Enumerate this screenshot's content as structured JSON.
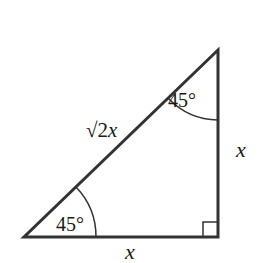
{
  "diagram": {
    "type": "right-isosceles-triangle",
    "vertices": {
      "apex": [
        218,
        50
      ],
      "bottom_left": [
        24,
        237
      ],
      "right_angle": [
        218,
        237
      ]
    },
    "labels": {
      "hypotenuse": "√2x",
      "hypotenuse_radical": "√2",
      "hypotenuse_var": "x",
      "right_side": "x",
      "bottom_side": "x",
      "top_angle": "45°",
      "bottom_angle": "45°"
    },
    "right_angle_marker": true,
    "colors": {
      "stroke": "#333333",
      "text": "#1a1a1a",
      "background": "#ffffff"
    }
  }
}
